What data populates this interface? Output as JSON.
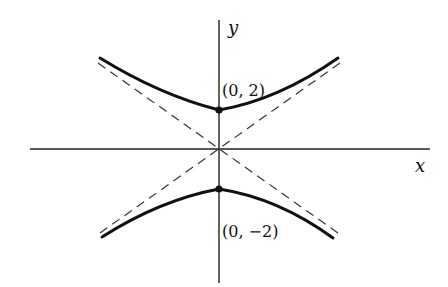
{
  "figure": {
    "type": "hyperbola",
    "equation_implied": "y^2/4 - x^2/4 = 1",
    "axes": {
      "x_label": "x",
      "y_label": "y"
    },
    "vertices": [
      {
        "label": "(0, 2)",
        "x": 0,
        "y": 2
      },
      {
        "label": "(0, −2)",
        "x": 0,
        "y": -2
      }
    ],
    "asymptotes": [
      "y = x",
      "y = -x"
    ],
    "colors": {
      "curve": "#111111",
      "axis": "#222222",
      "asymptote": "#333333",
      "background": "#ffffff"
    }
  }
}
